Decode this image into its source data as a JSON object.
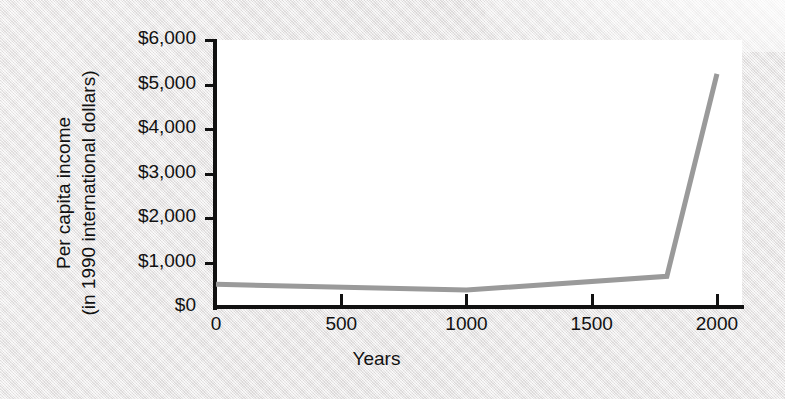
{
  "figure": {
    "background_color": "#eceaea",
    "plot_background_color": "#ffffff",
    "axis_color": "#111111",
    "line_color": "#9a9a9a"
  },
  "chart_data": {
    "type": "line",
    "title": "",
    "xlabel": "Years",
    "ylabel": "Per capita income\n(in 1990 international dollars)",
    "ylabel_line1": "Per capita income",
    "ylabel_line2": "(in 1990 international dollars)",
    "xlim": [
      0,
      2100
    ],
    "ylim": [
      0,
      6000
    ],
    "xticks": [
      0,
      500,
      1000,
      1500,
      2000
    ],
    "xticklabels": [
      "0",
      "500",
      "1000",
      "1500",
      "2000"
    ],
    "yticks": [
      0,
      1000,
      2000,
      3000,
      4000,
      5000,
      6000
    ],
    "yticklabels": [
      "$0",
      "$1,000",
      "$2,000",
      "$3,000",
      "$4,000",
      "$5,000",
      "$6,000"
    ],
    "grid": false,
    "legend": null,
    "series": [
      {
        "name": "Per capita income",
        "color": "#9a9a9a",
        "x": [
          0,
          1000,
          1800,
          2000
        ],
        "values": [
          510,
          380,
          690,
          5240
        ]
      }
    ]
  }
}
